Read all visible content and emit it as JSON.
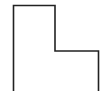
{
  "diagram": {
    "type": "line-drawing",
    "shape": "l-shaped-outline",
    "stroke_color": "#222222",
    "stroke_width": 1.6,
    "background": "#ffffff",
    "points": [
      [
        13.5,
        91
      ],
      [
        13.5,
        5.5
      ],
      [
        55,
        5.5
      ],
      [
        55,
        51
      ],
      [
        98.5,
        51
      ],
      [
        98.5,
        91
      ]
    ]
  }
}
